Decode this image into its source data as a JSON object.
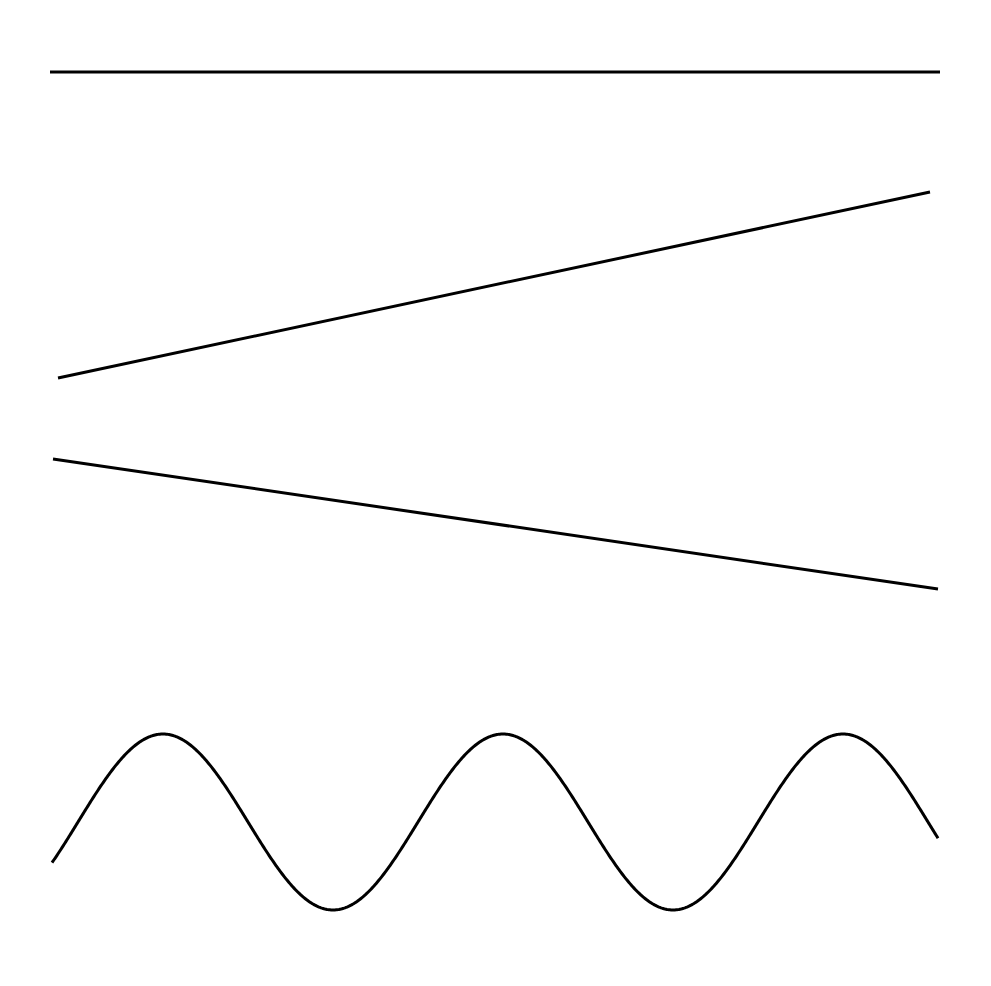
{
  "figure": {
    "background_color": "#ffffff",
    "width": 991,
    "height": 986,
    "stroke_color": "#000000",
    "has_axes": false,
    "has_labels": false,
    "has_legend": false
  },
  "chart_data": {
    "type": "line",
    "title": "",
    "subtitle": "",
    "xlabel": "",
    "ylabel": "",
    "xlim": [
      0,
      991
    ],
    "ylim": [
      986,
      0
    ],
    "grid": false,
    "legend_position": "none",
    "axes_visible": false,
    "tick_labels": [],
    "annotations": [],
    "series": [
      {
        "name": "horizontal-line",
        "shape": "straight",
        "color": "#000000",
        "stroke_width": 3,
        "points": [
          {
            "x": 50,
            "y": 72
          },
          {
            "x": 940,
            "y": 72
          }
        ],
        "description": "flat horizontal line near the top"
      },
      {
        "name": "ascending-line",
        "shape": "straight",
        "color": "#000000",
        "stroke_width": 3,
        "points": [
          {
            "x": 58,
            "y": 378
          },
          {
            "x": 930,
            "y": 192
          }
        ],
        "description": "line rising from lower-left to upper-right"
      },
      {
        "name": "descending-line",
        "shape": "straight",
        "color": "#000000",
        "stroke_width": 3,
        "points": [
          {
            "x": 53,
            "y": 459
          },
          {
            "x": 938,
            "y": 589
          }
        ],
        "description": "line falling from upper-left to lower-right"
      },
      {
        "name": "sine-wave",
        "shape": "sinusoid",
        "color": "#000000",
        "stroke_width": 3,
        "midline_y": 822,
        "amplitude": 88,
        "period": 340,
        "phase_x_first_peak": 163,
        "x_start": 52,
        "x_end": 938,
        "peaks": [
          {
            "x": 163,
            "y": 735
          },
          {
            "x": 480,
            "y": 735
          },
          {
            "x": 843,
            "y": 736
          }
        ],
        "troughs": [
          {
            "x": 320,
            "y": 909
          },
          {
            "x": 670,
            "y": 910
          }
        ],
        "endpoints": [
          {
            "x": 52,
            "y": 910
          },
          {
            "x": 938,
            "y": 912
          }
        ],
        "description": "wavy sinusoidal curve with three crests and two troughs"
      }
    ]
  }
}
